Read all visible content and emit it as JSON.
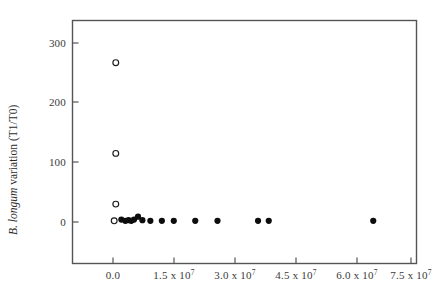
{
  "figure": {
    "background_color": "#ffffff",
    "frame_color": "#555555",
    "marker_color": "#0d0d0d"
  },
  "chart_data": {
    "type": "scatter",
    "title": "",
    "subtitle": "",
    "xlabel": "",
    "ylabel": "B. longum variation (T1/T0)",
    "ylabel_italic_part": "B. longum",
    "ylabel_plain_part": " variation (T1/T0)",
    "xlim": [
      -6000000,
      85000000
    ],
    "ylim": [
      -40,
      355
    ],
    "grid": false,
    "legend": false,
    "xticks": [
      0,
      15000000,
      30000000,
      45000000,
      60000000,
      75000000
    ],
    "xticklabels": [
      "0.0",
      "1.5 x 10",
      "3.0 x 10",
      "4.5 x 10",
      "6.0 x 10",
      "7.5 x 10"
    ],
    "xtick_exponents": [
      "",
      "7",
      "7",
      "7",
      "7",
      "7"
    ],
    "yticks": [
      0,
      100,
      200,
      300
    ],
    "yticklabels": [
      "0",
      "100",
      "200",
      "300"
    ],
    "series": [
      {
        "name": "open-markers",
        "marker": "open-circle",
        "points": [
          {
            "x": 700000,
            "y": 267
          },
          {
            "x": 700000,
            "y": 115
          },
          {
            "x": 700000,
            "y": 30
          },
          {
            "x": 300000,
            "y": 2
          }
        ]
      },
      {
        "name": "filled-markers",
        "marker": "filled-circle",
        "points": [
          {
            "x": 2100000,
            "y": 4
          },
          {
            "x": 3100000,
            "y": 2
          },
          {
            "x": 3900000,
            "y": 3
          },
          {
            "x": 4600000,
            "y": 2
          },
          {
            "x": 5300000,
            "y": 4
          },
          {
            "x": 6300000,
            "y": 9
          },
          {
            "x": 7400000,
            "y": 3
          },
          {
            "x": 9400000,
            "y": 2
          },
          {
            "x": 12300000,
            "y": 2
          },
          {
            "x": 15300000,
            "y": 2
          },
          {
            "x": 20700000,
            "y": 2
          },
          {
            "x": 26300000,
            "y": 2
          },
          {
            "x": 36500000,
            "y": 2
          },
          {
            "x": 39200000,
            "y": 2
          },
          {
            "x": 65500000,
            "y": 2
          }
        ]
      }
    ]
  }
}
